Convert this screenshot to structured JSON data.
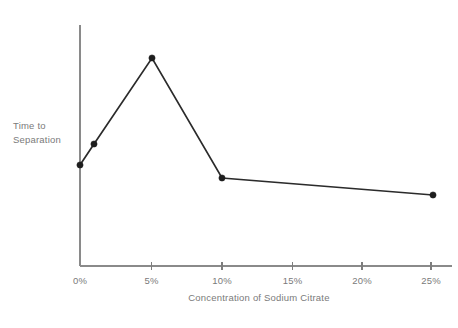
{
  "chart_data": {
    "type": "line",
    "title": "",
    "xlabel": "Concentration of Sodium Citrate",
    "ylabel": "Time to Separation",
    "ylabel_lines": [
      "Time to",
      "Separation"
    ],
    "x": [
      0,
      1,
      5,
      10,
      24.5
    ],
    "values": [
      0.38,
      0.47,
      1.0,
      0.3,
      0.24
    ],
    "xtick_labels": [
      "0%",
      "5%",
      "10%",
      "15%",
      "20%",
      "25%"
    ],
    "xtick_values": [
      0,
      5,
      10,
      15,
      20,
      25
    ],
    "ytick_labels": [],
    "xlim": [
      0,
      26.6
    ],
    "ylim": [
      0,
      1.12
    ],
    "grid": false,
    "legend": false,
    "series": [
      {
        "name": "Time to Separation",
        "points": [
          {
            "x": 0,
            "y": 0.38
          },
          {
            "x": 1,
            "y": 0.47
          },
          {
            "x": 5,
            "y": 1.0
          },
          {
            "x": 10,
            "y": 0.3
          },
          {
            "x": 24.5,
            "y": 0.24
          }
        ]
      }
    ],
    "colors": {
      "line": "#2b2b2b",
      "marker": "#1e1e1e",
      "axis": "#8a8a8a",
      "text": "#7a7a7a",
      "background": "#ffffff"
    },
    "marker_radius": 3.1,
    "geometry": {
      "axis_x": 80,
      "axis_top": 25,
      "axis_bottom": 266,
      "axis_right": 452,
      "tick_px": [
        80,
        151.5,
        222,
        292.5,
        362,
        431
      ],
      "tick_overhang": 4,
      "point_px": [
        {
          "x": 80,
          "y": 165
        },
        {
          "x": 94,
          "y": 144
        },
        {
          "x": 152,
          "y": 58
        },
        {
          "x": 222,
          "y": 178
        },
        {
          "x": 433,
          "y": 195
        }
      ],
      "xlabel_pos": {
        "x": 259,
        "y": 301
      },
      "ylabel_pos": {
        "x": 13,
        "y": 129
      },
      "ylabel_line_height": 14,
      "tick_label_y": 284
    }
  }
}
